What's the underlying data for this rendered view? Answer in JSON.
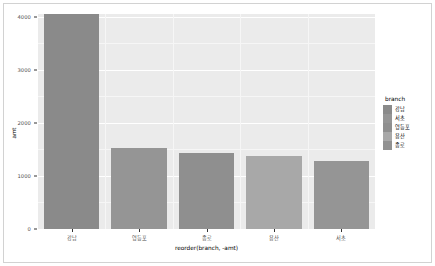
{
  "chart_data": {
    "type": "bar",
    "title": "",
    "xlabel": "reorder(branch, -amt)",
    "ylabel": "amt",
    "categories": [
      "강남",
      "영등포",
      "종로",
      "용산",
      "서초"
    ],
    "values": [
      4050,
      1520,
      1440,
      1380,
      1290
    ],
    "ylim": [
      0,
      4050
    ],
    "y_ticks": [
      0,
      1000,
      2000,
      3000,
      4000
    ],
    "y_tick_labels": [
      "0",
      "1000",
      "2000",
      "3000",
      "4000"
    ],
    "grid": true,
    "legend_position": "right",
    "bar_colors": [
      "#8a8a8a",
      "#959595",
      "#8f8f8f",
      "#a8a8a8",
      "#959595"
    ],
    "panel_background": "#ebebeb",
    "gridline_color": "#ffffff",
    "series": [
      {
        "name": "amt",
        "values": [
          4050,
          1520,
          1440,
          1380,
          1290
        ]
      }
    ]
  },
  "legend": {
    "title": "branch",
    "items": [
      {
        "label": "강남",
        "color": "#8a8a8a"
      },
      {
        "label": "서초",
        "color": "#959595"
      },
      {
        "label": "영등포",
        "color": "#8f8f8f"
      },
      {
        "label": "용산",
        "color": "#a8a8a8"
      },
      {
        "label": "종로",
        "color": "#919191"
      }
    ]
  },
  "axes": {
    "y_title": "amt",
    "x_title": "reorder(branch, -amt)"
  }
}
